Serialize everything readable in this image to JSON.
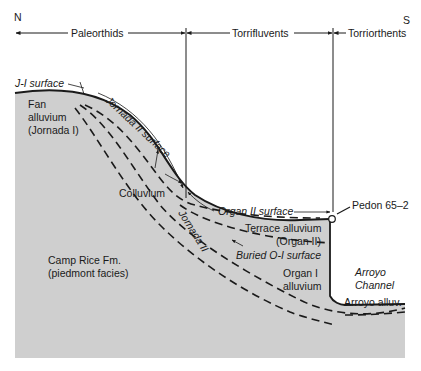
{
  "compass": {
    "north": "N",
    "south": "S"
  },
  "soil_zones": [
    {
      "label": "Paleorthids"
    },
    {
      "label": "Torrifluvents"
    },
    {
      "label": "Torriorthents"
    }
  ],
  "surfaces": {
    "j1": "J-I surface",
    "jornada2": "Jornada II surface",
    "organ2": "Organ II surface",
    "buried_o1": "Buried O-I surface"
  },
  "units": {
    "fan_alluvium": [
      "Fan",
      "alluvium",
      "(Jornada I)"
    ],
    "colluvium": "Colluvium",
    "jornada2": "Jornada II",
    "terrace_alluvium": [
      "Terrace alluvium",
      "(Organ II)"
    ],
    "organ1_alluvium": [
      "Organ I",
      "alluvium"
    ],
    "camp_rice": [
      "Camp Rice Fm.",
      "(piedmont facies)"
    ],
    "arroyo_channel": [
      "Arroyo",
      "Channel"
    ],
    "arroyo_alluvium": "Arroyo alluv."
  },
  "pedon": {
    "label": "Pedon 65–2"
  },
  "colors": {
    "fill": "#cfcfcf",
    "line": "#1a1a1a",
    "background": "#ffffff"
  }
}
